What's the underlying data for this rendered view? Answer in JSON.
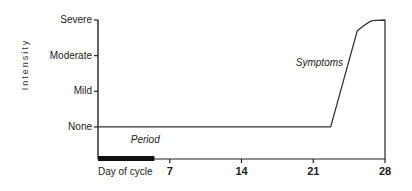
{
  "chart_data": {
    "type": "line",
    "title": "",
    "xlabel": "Day of cycle",
    "ylabel": "Intensity",
    "xlim": [
      0,
      28
    ],
    "x_ticks": [
      7,
      14,
      21,
      28
    ],
    "x_tick_labels": [
      "7",
      "14",
      "21",
      "28"
    ],
    "y_levels": [
      {
        "name": "None",
        "value": 0
      },
      {
        "name": "Mild",
        "value": 1
      },
      {
        "name": "Moderate",
        "value": 2
      },
      {
        "name": "Severe",
        "value": 3
      }
    ],
    "ylim": [
      -0.9,
      3
    ],
    "grid": false,
    "series": [
      {
        "name": "Symptoms",
        "points": [
          {
            "x": 0,
            "y": 0
          },
          {
            "x": 22.7,
            "y": 0
          },
          {
            "x": 25.3,
            "y": 2.7
          },
          {
            "x": 26.3,
            "y": 2.93
          },
          {
            "x": 28,
            "y": 3
          },
          {
            "x": 28,
            "y": -0.9
          }
        ]
      }
    ],
    "periods": [
      {
        "name": "Period",
        "start": 0,
        "end": 5.5
      }
    ],
    "annotations": [
      {
        "text": "Symptoms",
        "x": 19.3,
        "y": 1.7
      },
      {
        "text": "Period",
        "x": 3.2,
        "y": -0.45
      }
    ]
  }
}
